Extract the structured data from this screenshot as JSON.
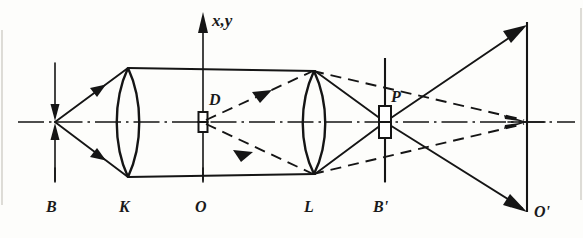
{
  "figure": {
    "axis_label": "x,y",
    "labels": {
      "object_plane": "B",
      "lens_first": "K",
      "origin": "O",
      "lens_second": "L",
      "image_plane": "B'",
      "final_plane": "O'",
      "aperture_field": "D",
      "aperture_pupil": "P"
    },
    "colors": {
      "ink": "#151515",
      "paper": "#fdfdfb"
    },
    "elements": [
      {
        "name": "object-arrow-B",
        "kind": "double-arrow",
        "x": 55
      },
      {
        "name": "lens-K",
        "kind": "biconvex-lens",
        "x": 128
      },
      {
        "name": "axis-origin-O",
        "kind": "vertical-axis",
        "x": 203
      },
      {
        "name": "aperture-D",
        "kind": "stop",
        "x": 203,
        "y": 122
      },
      {
        "name": "lens-L",
        "kind": "biconvex-lens",
        "x": 313
      },
      {
        "name": "screen-B-prime",
        "kind": "vertical-line",
        "x": 385
      },
      {
        "name": "aperture-P",
        "kind": "stop",
        "x": 385,
        "y": 122
      },
      {
        "name": "image-plane-O-prime",
        "kind": "vertical-line",
        "x": 527
      }
    ],
    "ray_bundles": [
      {
        "name": "solid-marginal-rays",
        "style": "solid",
        "from": "B",
        "through": "K, L, P",
        "to": "O'"
      },
      {
        "name": "dashed-chief-rays",
        "style": "dashed",
        "from": "D",
        "through": "L",
        "to": "P and beyond"
      }
    ]
  }
}
